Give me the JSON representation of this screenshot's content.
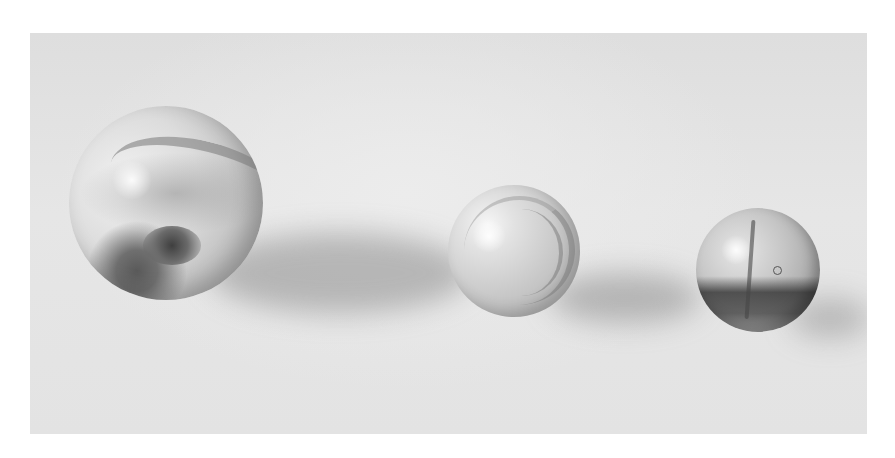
{
  "image": {
    "description": "Grayscale photograph of three glass marbles of decreasing size on a light surface",
    "palette": {
      "background_border": "#ffffff",
      "surface": "#e3e3e3",
      "shadow": "#9a9a9a"
    },
    "marbles": [
      {
        "name": "large-swirl-marble",
        "cx": 166,
        "cy": 203,
        "r": 97
      },
      {
        "name": "medium-swirl-marble",
        "cx": 514,
        "cy": 251,
        "r": 66
      },
      {
        "name": "small-clear-marble",
        "cx": 758,
        "cy": 270,
        "r": 62
      }
    ]
  }
}
